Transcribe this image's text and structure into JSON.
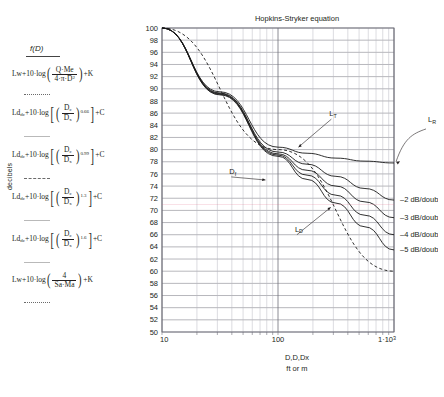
{
  "chart_data": {
    "type": "line",
    "title": "Hopkins-Stryker equation",
    "xlabel_line1": "D,D,Dx",
    "xlabel_line2": "ft or m",
    "ylabel": "decibels",
    "xscale": "log",
    "xlim": [
      10,
      1000
    ],
    "ylim": [
      50,
      100
    ],
    "xticks": [
      "10",
      "100",
      "1·10³"
    ],
    "yticks": [
      100,
      98,
      96,
      94,
      92,
      90,
      88,
      86,
      84,
      82,
      80,
      78,
      76,
      74,
      72,
      70,
      68,
      66,
      64,
      62,
      60,
      58,
      56,
      54,
      52,
      50
    ],
    "grid": true,
    "annotations": [
      {
        "name": "L_T",
        "label": "L",
        "sub": "T",
        "x": 300,
        "y": 83.5
      },
      {
        "name": "D_f",
        "label": "D",
        "sub": "f",
        "x": 45,
        "y": 76.5
      },
      {
        "name": "L_D",
        "label": "L",
        "sub": "D",
        "x": 150,
        "y": 68.5
      },
      {
        "name": "L_R",
        "label": "L",
        "sub": "R",
        "x": 1180,
        "y": 84.0
      }
    ],
    "right_labels": [
      "–2 dB/doubling",
      "–3 dB/doubling",
      "–4 dB/doubling",
      "–5 dB/doubling"
    ],
    "series": [
      {
        "name": "L_D inverse square (dashed)",
        "style": "dashed",
        "x": [
          10,
          100,
          1000
        ],
        "y": [
          100,
          80,
          60
        ]
      },
      {
        "name": "L_R -2 dB/doubling",
        "style": "solid",
        "x": [
          10,
          31.6,
          100,
          178,
          316,
          562,
          1000
        ],
        "y": [
          100,
          89.5,
          80.4,
          79.4,
          78.6,
          78.1,
          77.8
        ]
      },
      {
        "name": "-2 dB/doubling curve",
        "style": "solid",
        "x": [
          10,
          31.6,
          100,
          178,
          316,
          562,
          1000
        ],
        "y": [
          100,
          89.3,
          79.6,
          77.6,
          75.6,
          73.6,
          71.7
        ]
      },
      {
        "name": "-3 dB/doubling curve",
        "style": "solid",
        "x": [
          10,
          31.6,
          100,
          178,
          316,
          562,
          1000
        ],
        "y": [
          100,
          89.2,
          79.3,
          76.6,
          74.0,
          71.4,
          68.8
        ]
      },
      {
        "name": "-4 dB/doubling curve",
        "style": "solid",
        "x": [
          10,
          31.6,
          100,
          178,
          316,
          562,
          1000
        ],
        "y": [
          100,
          89.1,
          79.1,
          75.8,
          72.5,
          69.2,
          66.0
        ]
      },
      {
        "name": "-5 dB/doubling curve",
        "style": "solid",
        "x": [
          10,
          31.6,
          100,
          178,
          316,
          562,
          1000
        ],
        "y": [
          100,
          89.0,
          78.9,
          75.1,
          71.2,
          67.3,
          63.5
        ]
      }
    ]
  },
  "legend": {
    "axis_label": "decibels",
    "header": "f(D)",
    "rows": [
      {
        "id": "direct-field",
        "sep": "dotted",
        "prefix": "Lw+10·log",
        "bracket": "paren",
        "num": "Q·Me",
        "den": "4·π·D",
        "den_sup": "2",
        "exp": "",
        "suffix": "+K"
      },
      {
        "id": "exp-066",
        "sep": "solid-light",
        "prefix": "Ld",
        "prefix_sub": "dc",
        "prefix2": "+10·log",
        "bracket": "square",
        "num": "D",
        "num_sub": "c",
        "den": "D",
        "den_sub": "x",
        "exp": "0.66",
        "suffix": "+C"
      },
      {
        "id": "exp-099",
        "sep": "dashdot",
        "prefix": "Ld",
        "prefix_sub": "dc",
        "prefix2": "+10·log",
        "bracket": "square",
        "num": "D",
        "num_sub": "c",
        "den": "D",
        "den_sub": "x",
        "exp": "0.99",
        "suffix": "+C"
      },
      {
        "id": "exp-13",
        "sep": "solid-light",
        "prefix": "Ld",
        "prefix_sub": "dc",
        "prefix2": "+10·log",
        "bracket": "square",
        "num": "D",
        "num_sub": "c",
        "den": "D",
        "den_sub": "x",
        "exp": "1.3",
        "suffix": "+C"
      },
      {
        "id": "exp-16",
        "sep": "solid-light",
        "prefix": "Ld",
        "prefix_sub": "dc",
        "prefix2": "+10·log",
        "bracket": "square",
        "num": "D",
        "num_sub": "c",
        "den": "D",
        "den_sub": "x",
        "exp": "1.6",
        "suffix": "+C"
      },
      {
        "id": "reverberant",
        "sep": "solid-light",
        "prefix": "Lw+10·log",
        "bracket": "paren",
        "num": "4",
        "den": "Sa·Ma",
        "exp": "",
        "suffix": "+K"
      }
    ],
    "footer_sep": "dotted"
  },
  "colors": {
    "ink": "#231f20",
    "grid_major": "#6e6e78",
    "grid_minor": "#b8b8c0",
    "curve": "#1a1a1a",
    "accent_pink": "#e05a7a"
  }
}
